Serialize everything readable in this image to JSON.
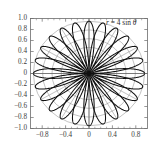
{
  "chart_data": {
    "type": "line",
    "title": "",
    "subtitle": "",
    "xlabel": "",
    "ylabel": "",
    "annotation": "r = 4 sin θ",
    "annotation_parts": {
      "r": "r",
      "eq": " = 4 sin ",
      "theta": "θ"
    },
    "curve": {
      "name": "polar rose r = 4 sin(6θ) normalized",
      "polar_equation": "r = 4 sin θ",
      "petals": 12,
      "petal_frequency": 6,
      "max_radius": 0.95,
      "tip_angles_deg": [
        15,
        45,
        75,
        105,
        135,
        165,
        195,
        225,
        255,
        285,
        315,
        345
      ]
    },
    "xlim": [
      -1.0,
      1.0
    ],
    "ylim": [
      -1.0,
      1.0
    ],
    "grid": "polar",
    "polar_grid": {
      "radial_circles": [
        0.158,
        0.317,
        0.475,
        0.633,
        0.792,
        0.95
      ],
      "spoke_count": 12,
      "spoke_step_deg": 30
    },
    "legend": "none",
    "xticks": [
      -0.8,
      -0.4,
      0,
      0.4,
      0.8
    ],
    "xticklabels": [
      "−0.8",
      "−0.4",
      "0",
      "0.4",
      "0.8"
    ],
    "yticks": [
      1.0,
      0.8,
      0.6,
      0.4,
      0.2,
      0,
      -0.2,
      -0.4,
      -0.6,
      -0.8,
      -1.0
    ],
    "yticklabels": [
      "1.0",
      "0.8",
      "0.6",
      "0.4",
      "0.2",
      "0",
      "−0.2",
      "−0.4",
      "−0.6",
      "−0.8",
      "−1.0"
    ],
    "minor_xticks": [
      -0.9,
      -0.7,
      -0.6,
      -0.5,
      -0.3,
      -0.2,
      -0.1,
      0.1,
      0.2,
      0.3,
      0.5,
      0.6,
      0.7,
      0.9
    ],
    "colors": {
      "curve": "#111111",
      "grid": "#8c8c8c",
      "axis": "#5a5a5a",
      "frame": "#6b6b6b",
      "text": "#2b2b2b",
      "background": "#ffffff"
    }
  }
}
